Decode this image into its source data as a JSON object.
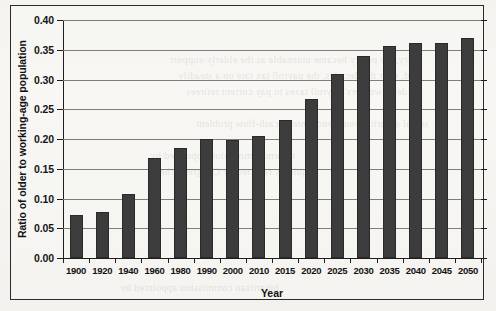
{
  "chart_data": {
    "type": "bar",
    "title": "",
    "xlabel": "Year",
    "ylabel": "Ratio of older to working-age population",
    "categories": [
      "1900",
      "1920",
      "1940",
      "1960",
      "1980",
      "1990",
      "2000",
      "2010",
      "2015",
      "2020",
      "2025",
      "2030",
      "2035",
      "2040",
      "2045",
      "2050"
    ],
    "values": [
      0.073,
      0.078,
      0.108,
      0.168,
      0.185,
      0.2,
      0.199,
      0.205,
      0.232,
      0.267,
      0.31,
      0.34,
      0.357,
      0.361,
      0.362,
      0.37
    ],
    "ylim": [
      0.0,
      0.4
    ],
    "ytick_labels": [
      "0.40",
      "0.35",
      "0.30",
      "0.25",
      "0.20",
      "0.15",
      "0.10",
      "0.05",
      "0.00"
    ],
    "ytick_values": [
      0.4,
      0.35,
      0.3,
      0.25,
      0.2,
      0.15,
      0.1,
      0.05,
      0.0
    ],
    "grid": true,
    "legend": "none",
    "bar_color": "#3c3c3c",
    "axis_color": "#1e1e1e",
    "grid_color": "#7e7e7e"
  },
  "page": {
    "background_color": "#f7f6f2",
    "frame_color": "#2b2b2b",
    "showthrough_lines": [
      "tary, the policy became untenable as the elderly-support",
      "and, over the decades, the payroll tax rate on a steadily",
      "elderly workers' payroll taxes to pay current retirees",
      "social security would encounter a cash-flow problem",
      "reform commission appointed by",
      "quickly rejected by Congress; the",
      "bipartisan commission appointed by"
    ]
  }
}
